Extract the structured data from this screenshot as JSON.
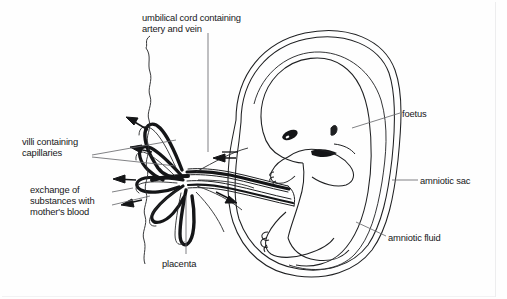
{
  "figure": {
    "style": "black and white line drawing",
    "ink_color": "#1a1b1d",
    "background_color": "#fefefe",
    "leader_line_color": "#5b5d60"
  },
  "labels": {
    "umbilical_cord": "umbilical cord containing\nartery and vein",
    "villi": "villi containing\ncapillaries",
    "exchange": "exchange of\nsubstances with\nmother's blood",
    "placenta": "placenta",
    "foetus": "foetus",
    "amniotic_sac": "amniotic sac",
    "amniotic_fluid": "amniotic fluid"
  }
}
